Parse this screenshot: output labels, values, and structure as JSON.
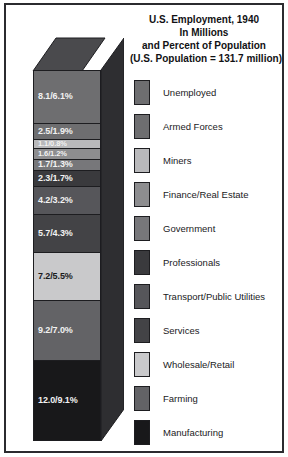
{
  "chart_data": {
    "type": "bar",
    "subtype": "stacked-3d-column",
    "title": "U.S. Employment, 1940",
    "title_lines": [
      "U.S. Employment, 1940",
      "In Millions",
      "and Percent of Population",
      "(U.S. Population = 131.7 million)"
    ],
    "subtitle": "In Millions and Percent of Population",
    "annotation": "(U.S. Population = 131.7 million)",
    "population_millions": 131.7,
    "units": "millions of people",
    "xlabel": "",
    "ylabel": "",
    "grid": false,
    "legend_position": "right",
    "categories": [
      "Unemployed",
      "Armed Forces",
      "Miners",
      "Finance/Real Estate",
      "Government",
      "Professionals",
      "Transport/Public Utilities",
      "Services",
      "Wholesale/Retail",
      "Farming",
      "Manufacturing"
    ],
    "values": [
      8.1,
      2.5,
      1.1,
      1.6,
      1.7,
      2.3,
      4.2,
      5.7,
      7.2,
      9.2,
      12.0
    ],
    "percents": [
      6.1,
      1.9,
      0.8,
      1.2,
      1.3,
      1.7,
      3.2,
      4.3,
      5.5,
      7.0,
      9.1
    ],
    "total_millions": 55.6,
    "total_percent": 42.1
  },
  "title": {
    "line1": "U.S. Employment, 1940",
    "line2": "In Millions",
    "line3": "and Percent of Population",
    "line4": "(U.S. Population = 131.7 million)"
  },
  "bar": {
    "segments": [
      {
        "label": "8.1/6.1%",
        "name": "unemployed",
        "value": 8.1,
        "percent": 6.1,
        "color": "#6e6e70",
        "height_px": 54,
        "text": "light",
        "tiny": false
      },
      {
        "label": "2.5/1.9%",
        "name": "armed-forces",
        "value": 2.5,
        "percent": 1.9,
        "color": "#6e6e70",
        "height_px": 17,
        "text": "light",
        "tiny": false
      },
      {
        "label": "1.1/0.8%",
        "name": "miners",
        "value": 1.1,
        "percent": 0.8,
        "color": "#b9b9bb",
        "height_px": 9,
        "text": "light",
        "tiny": true
      },
      {
        "label": "1.6/1.2%",
        "name": "finance-real-estate",
        "value": 1.6,
        "percent": 1.2,
        "color": "#8d8d8f",
        "height_px": 11,
        "text": "light",
        "tiny": true
      },
      {
        "label": "1.7/1.3%",
        "name": "government",
        "value": 1.7,
        "percent": 1.3,
        "color": "#77777a",
        "height_px": 12,
        "text": "light",
        "tiny": false
      },
      {
        "label": "2.3/1.7%",
        "name": "professionals",
        "value": 2.3,
        "percent": 1.7,
        "color": "#3a3a3d",
        "height_px": 16,
        "text": "light",
        "tiny": false
      },
      {
        "label": "4.2/3.2%",
        "name": "transport-public-utilities",
        "value": 4.2,
        "percent": 3.2,
        "color": "#56565a",
        "height_px": 29,
        "text": "light",
        "tiny": false
      },
      {
        "label": "5.7/4.3%",
        "name": "services",
        "value": 5.7,
        "percent": 4.3,
        "color": "#434346",
        "height_px": 39,
        "text": "light",
        "tiny": false
      },
      {
        "label": "7.2/5.5%",
        "name": "wholesale-retail",
        "value": 7.2,
        "percent": 5.5,
        "color": "#c9c9cb",
        "height_px": 49,
        "text": "dark",
        "tiny": false
      },
      {
        "label": "9.2/7.0%",
        "name": "farming",
        "value": 9.2,
        "percent": 7.0,
        "color": "#636366",
        "height_px": 62,
        "text": "light",
        "tiny": false
      },
      {
        "label": "12.0/9.1%",
        "name": "manufacturing",
        "value": 12.0,
        "percent": 9.1,
        "color": "#18181a",
        "height_px": 81,
        "text": "light",
        "tiny": false
      }
    ]
  },
  "legend": {
    "items": [
      {
        "label": "Unemployed",
        "color": "#6e6e70"
      },
      {
        "label": "Armed Forces",
        "color": "#6e6e70"
      },
      {
        "label": "Miners",
        "color": "#b9b9bb"
      },
      {
        "label": "Finance/Real Estate",
        "color": "#8d8d8f"
      },
      {
        "label": "Government",
        "color": "#77777a"
      },
      {
        "label": "Professionals",
        "color": "#3a3a3d"
      },
      {
        "label": "Transport/Public Utilities",
        "color": "#56565a"
      },
      {
        "label": "Services",
        "color": "#434346"
      },
      {
        "label": "Wholesale/Retail",
        "color": "#c9c9cb"
      },
      {
        "label": "Farming",
        "color": "#636366"
      },
      {
        "label": "Manufacturing",
        "color": "#18181a"
      }
    ]
  },
  "colors": {
    "frame_border": "#2b2b2f",
    "background": "#ffffff",
    "bar_outline": "#1d1d20",
    "bar_top_face": "#4a4a4d",
    "bar_side_face": "#2e2e31"
  }
}
